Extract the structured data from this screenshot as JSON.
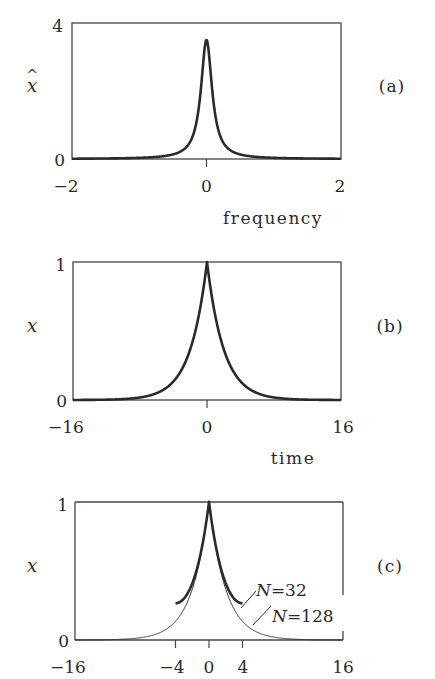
{
  "chart_data": [
    {
      "id": "a",
      "type": "line",
      "panel_label": "(a)",
      "title": "",
      "xlabel": "frequency",
      "ylabel": "x̂",
      "xlim": [
        -2,
        2
      ],
      "ylim": [
        0,
        4
      ],
      "xticks": [
        -2,
        0,
        2
      ],
      "xtick_labels": [
        "−2",
        "0",
        "2"
      ],
      "yticks": [
        0,
        4
      ],
      "ytick_labels": [
        "0",
        "4"
      ],
      "grid": false,
      "series": [
        {
          "name": "spectrum",
          "model": "lorentzian",
          "peak": 3.5,
          "half_width": 0.1,
          "x": [
            -2,
            -1,
            -0.5,
            -0.3,
            -0.2,
            -0.1,
            -0.05,
            0,
            0.05,
            0.1,
            0.2,
            0.3,
            0.5,
            1,
            2
          ],
          "values": [
            0.01,
            0.03,
            0.13,
            0.35,
            0.7,
            1.75,
            2.8,
            3.5,
            2.8,
            1.75,
            0.7,
            0.35,
            0.13,
            0.03,
            0.01
          ]
        }
      ]
    },
    {
      "id": "b",
      "type": "line",
      "panel_label": "(b)",
      "title": "",
      "xlabel": "time",
      "ylabel": "x",
      "xlim": [
        -16,
        16
      ],
      "ylim": [
        0,
        1
      ],
      "xticks": [
        -16,
        0,
        16
      ],
      "xtick_labels": [
        "−16",
        "0",
        "16"
      ],
      "yticks": [
        0,
        1
      ],
      "ytick_labels": [
        "0",
        "1"
      ],
      "grid": false,
      "series": [
        {
          "name": "signal",
          "model": "two-sided exponential exp(-|t|/2)",
          "x": [
            -16,
            -8,
            -6,
            -4,
            -2,
            -1,
            0,
            1,
            2,
            4,
            6,
            8,
            16
          ],
          "values": [
            0.0,
            0.02,
            0.05,
            0.14,
            0.37,
            0.61,
            1.0,
            0.61,
            0.37,
            0.14,
            0.05,
            0.02,
            0.0
          ]
        }
      ]
    },
    {
      "id": "c",
      "type": "line",
      "panel_label": "(c)",
      "title": "",
      "xlabel": "",
      "ylabel": "x",
      "xlim": [
        -16,
        16
      ],
      "ylim": [
        0,
        1
      ],
      "xticks": [
        -16,
        -4,
        0,
        4,
        16
      ],
      "xtick_labels": [
        "−16",
        "−4",
        "0",
        "4",
        "16"
      ],
      "yticks": [
        0,
        1
      ],
      "ytick_labels": [
        "0",
        "1"
      ],
      "grid": false,
      "series": [
        {
          "name": "N=32",
          "style": "thick",
          "x": [
            -4,
            -2,
            -1,
            0,
            1,
            2,
            4
          ],
          "values": [
            0.19,
            0.4,
            0.62,
            1.0,
            0.62,
            0.4,
            0.19
          ]
        },
        {
          "name": "N=128",
          "style": "thin",
          "x": [
            -16,
            -8,
            -6,
            -4,
            -2,
            -1,
            0,
            1,
            2,
            4,
            6,
            8,
            16
          ],
          "values": [
            0.0,
            0.02,
            0.05,
            0.14,
            0.37,
            0.61,
            1.0,
            0.61,
            0.37,
            0.14,
            0.05,
            0.02,
            0.0
          ]
        }
      ],
      "annotations": [
        "N=32",
        "N=128"
      ]
    }
  ]
}
